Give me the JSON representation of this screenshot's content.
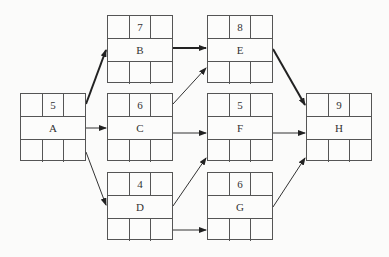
{
  "nodes": {
    "A": {
      "label": "A",
      "duration": "5"
    },
    "B": {
      "label": "B",
      "duration": "7"
    },
    "C": {
      "label": "C",
      "duration": "6"
    },
    "D": {
      "label": "D",
      "duration": "4"
    },
    "E": {
      "label": "E",
      "duration": "8"
    },
    "F": {
      "label": "F",
      "duration": "5"
    },
    "G": {
      "label": "G",
      "duration": "6"
    },
    "H": {
      "label": "H",
      "duration": "9"
    }
  },
  "edges": [
    {
      "from": "A",
      "to": "B",
      "critical": true
    },
    {
      "from": "A",
      "to": "C",
      "critical": false
    },
    {
      "from": "A",
      "to": "D",
      "critical": false
    },
    {
      "from": "B",
      "to": "E",
      "critical": true
    },
    {
      "from": "C",
      "to": "E",
      "critical": false
    },
    {
      "from": "C",
      "to": "F",
      "critical": false
    },
    {
      "from": "D",
      "to": "F",
      "critical": false
    },
    {
      "from": "D",
      "to": "G",
      "critical": false
    },
    {
      "from": "E",
      "to": "H",
      "critical": true
    },
    {
      "from": "F",
      "to": "H",
      "critical": false
    },
    {
      "from": "G",
      "to": "H",
      "critical": false
    }
  ],
  "colors": {
    "line": "#333333",
    "border": "#555555",
    "background": "#fbfbfa"
  }
}
